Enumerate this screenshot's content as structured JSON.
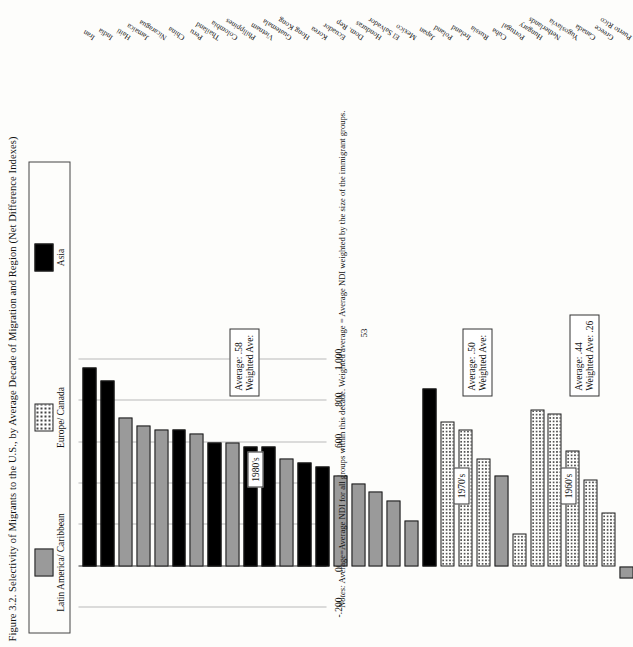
{
  "figure": {
    "title": "Figure 3.2. Selectivity of Migrants to the U.S., by Average Decade of Migration and Region (Net Difference Indexes)",
    "page_number": "53",
    "notes_label": "Notes:",
    "notes_text": " Average=Average NDI for all groups within this decade. Weighted average = Average NDI weighted by the size of the immigrant groups."
  },
  "legend": {
    "items": [
      {
        "label": "Latin America/ Caribbean",
        "swatch": "latin",
        "color": "#9a9a9a"
      },
      {
        "label": "Europe/ Canada",
        "swatch": "europe",
        "color": "#ffffff"
      },
      {
        "label": "Asia",
        "swatch": "asia",
        "color": "#000000"
      }
    ]
  },
  "annotations": {
    "decades": [
      {
        "label": "1960's"
      },
      {
        "label": "1970's"
      },
      {
        "label": "1980's"
      }
    ],
    "averages": [
      {
        "average_label": "Average: .44",
        "weighted_label": "Weighted Ave: .26"
      },
      {
        "average_label": "Average: .50",
        "weighted_label": "Weighted Ave:"
      },
      {
        "average_label": "Average: .58",
        "weighted_label": "Weighted Ave:"
      }
    ]
  },
  "chart_data": {
    "type": "bar",
    "orientation": "vertical",
    "title": "Figure 3.2. Selectivity of Migrants to the U.S., by Average Decade of Migration and Region (Net Difference Indexes)",
    "xlabel": "",
    "ylabel": "Net Difference Index",
    "ylim": [
      -0.2,
      1.0
    ],
    "yticks": [
      1.0,
      0.8,
      0.6,
      0.4,
      0.2,
      0.0,
      -0.2
    ],
    "ytick_labels": [
      "1.000",
      ".800",
      ".600",
      ".400",
      ".200",
      ".000",
      "-.200"
    ],
    "grid": true,
    "legend_position": "top",
    "categories": [
      "Iran",
      "India",
      "Haiti",
      "Jamaica",
      "Nicaragua",
      "China",
      "Peru",
      "Thailand",
      "Colombia",
      "Philippines",
      "Vietnam",
      "Guatemala",
      "Hong Kong",
      "Korea",
      "Ecuador",
      "Dom. Rep",
      "Honduras",
      "El Salvador",
      "Mexico",
      "Japan",
      "Poland",
      "Ireland",
      "Russia",
      "Cuba",
      "Portugal",
      "Hungary",
      "Netherlands",
      "Yugoslavia",
      "Canada",
      "Greece",
      "Puerto Rico"
    ],
    "values": [
      0.96,
      0.9,
      0.72,
      0.68,
      0.66,
      0.66,
      0.64,
      0.6,
      0.6,
      0.58,
      0.58,
      0.52,
      0.5,
      0.48,
      0.44,
      0.4,
      0.36,
      0.32,
      0.22,
      0.86,
      0.7,
      0.66,
      0.52,
      0.44,
      0.16,
      0.76,
      0.74,
      0.56,
      0.42,
      0.26,
      -0.06
    ],
    "groups": [
      "asia",
      "asia",
      "latin",
      "latin",
      "latin",
      "asia",
      "latin",
      "asia",
      "latin",
      "asia",
      "asia",
      "latin",
      "asia",
      "asia",
      "latin",
      "latin",
      "latin",
      "latin",
      "latin",
      "asia",
      "europe",
      "europe",
      "europe",
      "latin",
      "europe",
      "europe",
      "europe",
      "europe",
      "europe",
      "europe",
      "latin"
    ],
    "decade_of_group": [
      "1980s",
      "1980s",
      "1980s",
      "1980s",
      "1980s",
      "1980s",
      "1980s",
      "1980s",
      "1980s",
      "1980s",
      "1980s",
      "1980s",
      "1980s",
      "1980s",
      "1980s",
      "1980s",
      "1980s",
      "1980s",
      "1980s",
      "1970s",
      "1970s",
      "1970s",
      "1970s",
      "1970s",
      "1970s",
      "1960s",
      "1960s",
      "1960s",
      "1960s",
      "1960s",
      "1960s"
    ],
    "decade_averages": [
      {
        "decade": "1980's",
        "average": 0.58,
        "weighted_average": null
      },
      {
        "decade": "1970's",
        "average": 0.5,
        "weighted_average": null
      },
      {
        "decade": "1960's",
        "average": 0.44,
        "weighted_average": 0.26
      }
    ]
  }
}
